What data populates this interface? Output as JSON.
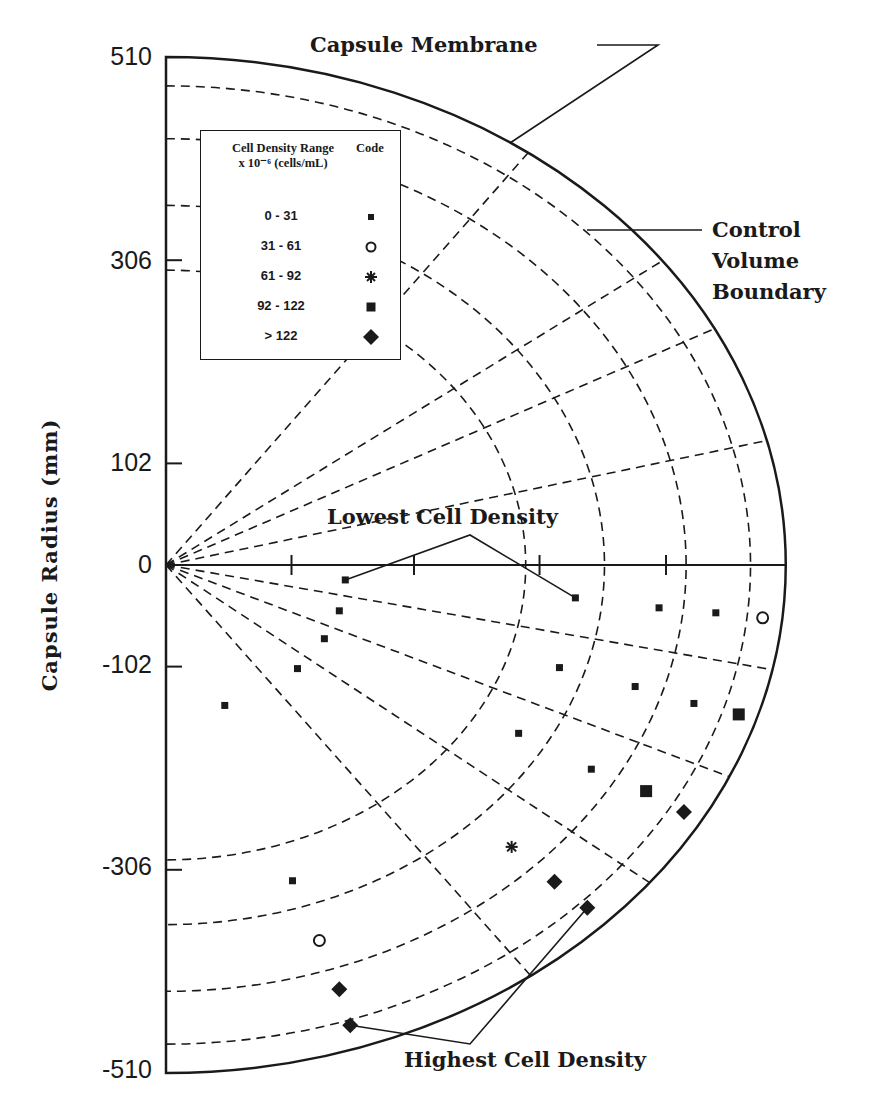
{
  "chart_data": {
    "type": "scatter",
    "title": "",
    "xlabel": "",
    "ylabel": "Capsule Radius (mm)",
    "y_ticks": [
      510,
      306,
      102,
      0,
      -102,
      -306,
      -510
    ],
    "ylim": [
      -510,
      510
    ],
    "x_unit_note": "x positions estimated in mm along capsule axis (no x tick labels shown)",
    "grid": {
      "style": "dashed polar",
      "arc_radii_mm": [
        296,
        361,
        428,
        481
      ],
      "radial_angles_deg": [
        48.7,
        31.5,
        23.3,
        11.7,
        -9.8,
        -20.6,
        -33.3,
        -48.4
      ]
    },
    "boundaries": {
      "capsule_membrane_radius_mm": 510,
      "x_stretch": 1.22
    },
    "legend": {
      "title": "Cell Density Range",
      "subtitle": "x 10-6 (cells/mL)",
      "code_header": "Code",
      "entries": [
        {
          "range": "0 - 31",
          "symbol": "small-square"
        },
        {
          "range": "31 - 61",
          "symbol": "open-circle"
        },
        {
          "range": "61 - 92",
          "symbol": "asterisk"
        },
        {
          "range": "92 - 122",
          "symbol": "large-square"
        },
        {
          "range": "> 122",
          "symbol": "diamond"
        }
      ]
    },
    "series": [
      {
        "name": "0 - 31",
        "symbol": "small-square",
        "points": [
          [
            180,
            -15
          ],
          [
            411,
            -33
          ],
          [
            174,
            -46
          ],
          [
            159,
            -74
          ],
          [
            132,
            -104
          ],
          [
            59,
            -141
          ],
          [
            495,
            -43
          ],
          [
            552,
            -48
          ],
          [
            395,
            -103
          ],
          [
            471,
            -122
          ],
          [
            530,
            -139
          ],
          [
            354,
            -169
          ],
          [
            427,
            -205
          ],
          [
            127,
            -317
          ]
        ]
      },
      {
        "name": "31 - 61",
        "symbol": "open-circle",
        "points": [
          [
            599,
            -53
          ],
          [
            154,
            -377
          ]
        ]
      },
      {
        "name": "61 - 92",
        "symbol": "asterisk",
        "points": [
          [
            347,
            -283
          ]
        ]
      },
      {
        "name": "92 - 122",
        "symbol": "large-square",
        "points": [
          [
            575,
            -150
          ],
          [
            482,
            -227
          ]
        ]
      },
      {
        "name": "> 122",
        "symbol": "diamond",
        "points": [
          [
            520,
            -248
          ],
          [
            390,
            -318
          ],
          [
            423,
            -344
          ],
          [
            174,
            -426
          ],
          [
            185,
            -462
          ]
        ]
      }
    ],
    "x_axis_ticks_mm": [
      126,
      249,
      375,
      502
    ],
    "annotations": [
      {
        "text": "Capsule Membrane",
        "points_to": "outer solid boundary"
      },
      {
        "text": "Control Volume Boundary",
        "points_to": "outermost dashed arc"
      },
      {
        "text": "Lowest Cell Density",
        "points_to": [
          [
            180,
            -15
          ],
          [
            411,
            -33
          ]
        ]
      },
      {
        "text": "Highest Cell Density",
        "points_to": [
          [
            185,
            -462
          ],
          [
            423,
            -344
          ]
        ]
      }
    ]
  },
  "labels": {
    "y_title": "Capsule  Radius  (mm)",
    "ticks": [
      {
        "text": "510",
        "y": 42
      },
      {
        "text": "306",
        "y": 246
      },
      {
        "text": "102",
        "y": 448
      },
      {
        "text": "0",
        "y": 550
      },
      {
        "text": "-102",
        "y": 650
      },
      {
        "text": "-306",
        "y": 852
      },
      {
        "text": "-510",
        "y": 1055
      }
    ],
    "capsule_membrane": "Capsule  Membrane",
    "cvb_line1": "Control",
    "cvb_line2": "Volume",
    "cvb_line3": "Boundary",
    "lowest": "Lowest Cell Density",
    "highest": "Highest Cell Density",
    "legend_title": "Cell Density Range",
    "legend_sub": "x 10⁻⁶ (cells/mL)",
    "legend_code": "Code",
    "legend_rows": [
      "0 - 31",
      "31 - 61",
      "61 - 92",
      "92 - 122",
      ">  122"
    ]
  },
  "colors": {
    "ink": "#1a1a1a",
    "background": "#ffffff"
  }
}
